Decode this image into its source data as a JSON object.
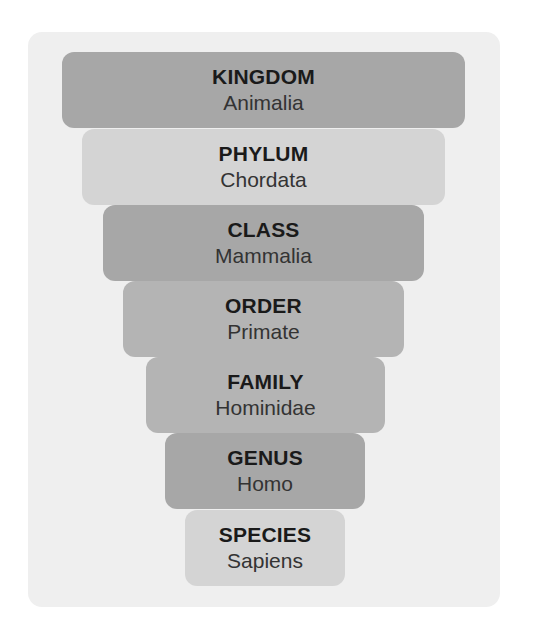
{
  "diagram": {
    "type": "taxonomy-funnel",
    "colors": {
      "panel_bg": "#efefef",
      "tier_dark": "#a7a7a7",
      "tier_mid": "#b4b4b4",
      "tier_light": "#d4d4d4",
      "rank_text": "#1a1a1a",
      "name_text": "#333333"
    },
    "tiers": [
      {
        "rank": "KINGDOM",
        "name": "Animalia"
      },
      {
        "rank": "PHYLUM",
        "name": "Chordata"
      },
      {
        "rank": "CLASS",
        "name": "Mammalia"
      },
      {
        "rank": "ORDER",
        "name": "Primate"
      },
      {
        "rank": "FAMILY",
        "name": "Hominidae"
      },
      {
        "rank": "GENUS",
        "name": "Homo"
      },
      {
        "rank": "SPECIES",
        "name": "Sapiens"
      }
    ]
  }
}
